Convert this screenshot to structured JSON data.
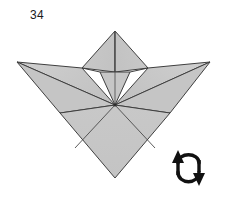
{
  "diagram": {
    "step_number": "34",
    "type": "origami-fold-step",
    "colors": {
      "paper_fill": "#c6c6c6",
      "paper_fill_light": "#cdcdcd",
      "paper_fill_dark": "#bdbdbd",
      "line": "#3a3a3a",
      "line_soft": "#555555",
      "background": "#ffffff",
      "symbol": "#111111"
    },
    "model": {
      "name": "bird-base-variant",
      "apex": [
        115,
        31
      ],
      "center_vertex": [
        115,
        105
      ],
      "bottom_tip": [
        115,
        178
      ],
      "left_tip": [
        17,
        62
      ],
      "right_tip": [
        210,
        62
      ]
    },
    "symbol": {
      "name": "turn-over-symbol",
      "label": "turn over",
      "position": [
        170,
        152
      ],
      "left_arrow_direction": "up",
      "right_arrow_direction": "down"
    }
  }
}
